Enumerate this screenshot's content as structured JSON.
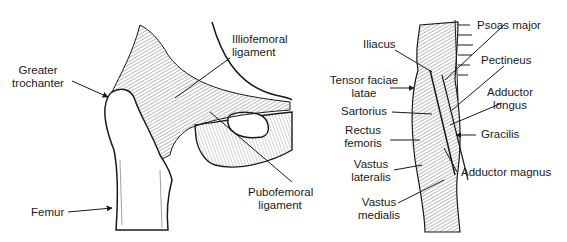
{
  "left_panel": {
    "title": "Hip joint ligaments",
    "labels": {
      "greater_trochanter_1": "Greater",
      "greater_trochanter_2": "trochanter",
      "iliofemoral_1": "Illiofemoral",
      "iliofemoral_2": "ligament",
      "pubofemoral_1": "Pubofemoral",
      "pubofemoral_2": "ligament",
      "femur": "Femur"
    }
  },
  "right_panel": {
    "title": "Anterior thigh muscles",
    "labels": {
      "psoas_major": "Psoas major",
      "iliacus": "Iliacus",
      "pectineus": "Pectineus",
      "tensor_1": "Tensor faciae",
      "tensor_2": "latae",
      "adductor_longus_1": "Adductor",
      "adductor_longus_2": "longus",
      "sartorius": "Sartorius",
      "rectus_1": "Rectus",
      "rectus_2": "femoris",
      "gracilis": "Gracilis",
      "vastus_lateralis_1": "Vastus",
      "vastus_lateralis_2": "lateralis",
      "adductor_magnus": "Adductor magnus",
      "vastus_medialis_1": "Vastus",
      "vastus_medialis_2": "medialis"
    }
  },
  "colors": {
    "ink": "#1a1a1a",
    "shade": "#8a8a8a",
    "background": "#ffffff"
  }
}
